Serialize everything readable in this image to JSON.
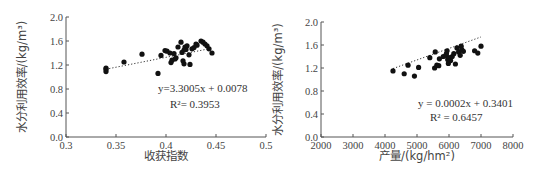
{
  "chart_data": [
    {
      "type": "scatter",
      "title": "",
      "xlabel": "收获指数",
      "ylabel": "水分利用效率/(kg/m³)",
      "xlim": [
        0.3,
        0.5
      ],
      "ylim": [
        0.0,
        2.0
      ],
      "xticks": [
        "0.3",
        "0.35",
        "0.4",
        "0.45",
        "0.5"
      ],
      "yticks": [
        "0.0",
        "0.4",
        "0.8",
        "1.2",
        "1.6",
        "2.0"
      ],
      "grid": false,
      "trendline": {
        "style": "dotted",
        "slope": 3.3005,
        "intercept": 0.0078,
        "x_range": [
          0.34,
          0.445
        ]
      },
      "annotations": [
        "y=3.3005x + 0.0078",
        "R²= 0.3953"
      ],
      "points": [
        [
          0.34,
          1.09
        ],
        [
          0.34,
          1.13
        ],
        [
          0.34,
          1.15
        ],
        [
          0.358,
          1.25
        ],
        [
          0.376,
          1.38
        ],
        [
          0.392,
          1.06
        ],
        [
          0.395,
          1.36
        ],
        [
          0.399,
          1.44
        ],
        [
          0.401,
          1.43
        ],
        [
          0.404,
          1.4
        ],
        [
          0.405,
          1.24
        ],
        [
          0.406,
          1.28
        ],
        [
          0.408,
          1.39
        ],
        [
          0.409,
          1.3
        ],
        [
          0.41,
          1.32
        ],
        [
          0.412,
          1.5
        ],
        [
          0.415,
          1.58
        ],
        [
          0.416,
          1.41
        ],
        [
          0.417,
          1.27
        ],
        [
          0.418,
          1.22
        ],
        [
          0.418,
          1.45
        ],
        [
          0.419,
          1.5
        ],
        [
          0.42,
          1.46
        ],
        [
          0.421,
          1.52
        ],
        [
          0.423,
          1.37
        ],
        [
          0.424,
          1.21
        ],
        [
          0.426,
          1.47
        ],
        [
          0.428,
          1.49
        ],
        [
          0.43,
          1.55
        ],
        [
          0.431,
          1.53
        ],
        [
          0.435,
          1.6
        ],
        [
          0.437,
          1.58
        ],
        [
          0.439,
          1.55
        ],
        [
          0.441,
          1.52
        ],
        [
          0.443,
          1.47
        ],
        [
          0.446,
          1.4
        ]
      ]
    },
    {
      "type": "scatter",
      "title": "",
      "xlabel": "产量/(kg/hm²)",
      "ylabel": "水分利用效率/(kg/m³)",
      "xlim": [
        2000,
        8000
      ],
      "ylim": [
        0.0,
        2.0
      ],
      "xticks": [
        "2000",
        "3000",
        "4000",
        "5000",
        "6000",
        "7000",
        "8000"
      ],
      "yticks": [
        "0.0",
        "0.4",
        "0.8",
        "1.2",
        "1.6",
        "2.0"
      ],
      "grid": false,
      "trendline": {
        "style": "dotted",
        "slope": 0.0002,
        "intercept": 0.3401,
        "x_range": [
          4250,
          7000
        ]
      },
      "annotations": [
        "y = 0.0002x + 0.3401",
        "R² = 0.6457"
      ],
      "points": [
        [
          4250,
          1.15
        ],
        [
          4600,
          1.1
        ],
        [
          4720,
          1.25
        ],
        [
          4920,
          1.06
        ],
        [
          5050,
          1.21
        ],
        [
          5400,
          1.38
        ],
        [
          5550,
          1.2
        ],
        [
          5570,
          1.48
        ],
        [
          5620,
          1.25
        ],
        [
          5680,
          1.24
        ],
        [
          5700,
          1.36
        ],
        [
          5820,
          1.4
        ],
        [
          5900,
          1.42
        ],
        [
          5920,
          1.45
        ],
        [
          5940,
          1.5
        ],
        [
          5960,
          1.35
        ],
        [
          5980,
          1.28
        ],
        [
          6000,
          1.38
        ],
        [
          6050,
          1.33
        ],
        [
          6100,
          1.4
        ],
        [
          6150,
          1.45
        ],
        [
          6200,
          1.27
        ],
        [
          6250,
          1.55
        ],
        [
          6300,
          1.48
        ],
        [
          6350,
          1.42
        ],
        [
          6380,
          1.58
        ],
        [
          6400,
          1.52
        ],
        [
          6450,
          1.49
        ],
        [
          6800,
          1.5
        ],
        [
          6900,
          1.46
        ],
        [
          7000,
          1.58
        ]
      ]
    }
  ]
}
